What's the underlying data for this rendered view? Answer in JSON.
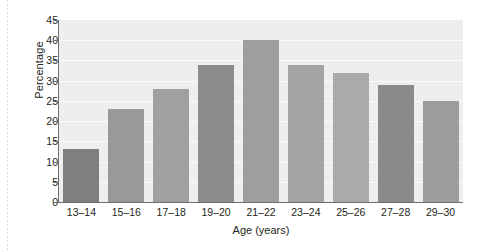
{
  "chart_data": {
    "type": "bar",
    "title": "",
    "xlabel": "Age (years)",
    "ylabel": "Percentage",
    "categories": [
      "13–14",
      "15–16",
      "17–18",
      "19–20",
      "21–22",
      "23–24",
      "25–26",
      "27–28",
      "29–30"
    ],
    "values": [
      13,
      23,
      28,
      34,
      40,
      34,
      32,
      29,
      25
    ],
    "bar_colors": [
      "#7f7f7f",
      "#999999",
      "#a0a0a0",
      "#8c8c8c",
      "#9e9e9e",
      "#a3a3a3",
      "#aaaaaa",
      "#8a8a8a",
      "#9c9c9c"
    ],
    "ylim": [
      0,
      45
    ],
    "ytick_values": [
      0,
      5,
      10,
      15,
      20,
      25,
      30,
      35,
      40,
      45
    ],
    "ytick_labels": [
      "0",
      "5",
      "10",
      "15",
      "20",
      "25",
      "30",
      "35",
      "40",
      "45"
    ],
    "grid": true,
    "grid_color": "#fbfbfb",
    "plot_background": "#eeeeee",
    "axis_color": "#6f6f6f",
    "legend": null,
    "legend_position": "none"
  }
}
